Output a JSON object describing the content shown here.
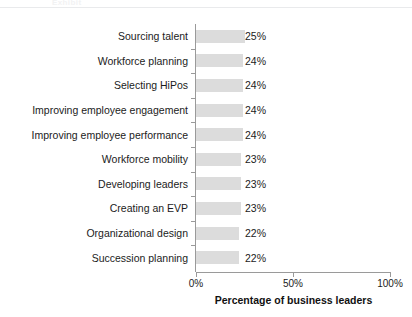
{
  "header": {
    "ghost_text": "Exhibit",
    "rule_color": "#e9eaec"
  },
  "chart_data": {
    "type": "bar",
    "orientation": "horizontal",
    "title": "",
    "subtitle": "",
    "xlabel": "Percentage of business leaders",
    "ylabel": "",
    "xlim": [
      0,
      100
    ],
    "xticks": [
      "0%",
      "50%",
      "100%"
    ],
    "xtick_values": [
      0,
      50,
      100
    ],
    "grid": false,
    "legend": false,
    "bar_color": "#dcdcdc",
    "axis_color": "#9a9a9a",
    "categories": [
      "Sourcing talent",
      "Workforce planning",
      "Selecting HiPos",
      "Improving employee engagement",
      "Improving employee performance",
      "Workforce mobility",
      "Developing leaders",
      "Creating an EVP",
      "Organizational design",
      "Succession planning"
    ],
    "values": [
      25,
      24,
      24,
      24,
      24,
      23,
      23,
      23,
      22,
      22
    ],
    "value_labels": [
      "25%",
      "24%",
      "24%",
      "24%",
      "24%",
      "23%",
      "23%",
      "23%",
      "22%",
      "22%"
    ]
  }
}
